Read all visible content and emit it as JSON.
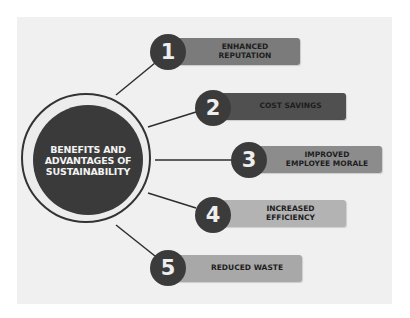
{
  "diagram": {
    "center": {
      "title": "BENEFITS AND\nADVANTAGES OF\nSUSTAINABILITY"
    },
    "items": [
      {
        "number": "1",
        "label": "ENHANCED\nREPUTATION",
        "color": "#7b7b7b"
      },
      {
        "number": "2",
        "label": "COST SAVINGS",
        "color": "#505050"
      },
      {
        "number": "3",
        "label": "IMPROVED\nEMPLOYEE MORALE",
        "color": "#8c8c8c"
      },
      {
        "number": "4",
        "label": "INCREASED\nEFFICIENCY",
        "color": "#b3b3b3"
      },
      {
        "number": "5",
        "label": "REDUCED WASTE",
        "color": "#a8a8a8"
      }
    ],
    "colors": {
      "background": "#f0f0f0",
      "hub": "#3a3a3a",
      "badge": "#3b3b3b",
      "connector": "#2e2e2e"
    }
  }
}
